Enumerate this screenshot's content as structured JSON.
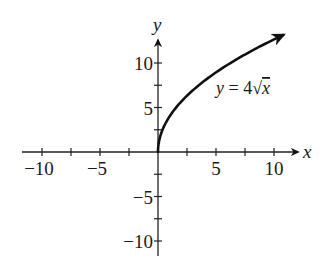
{
  "chart_data": {
    "type": "line",
    "title": "",
    "xlabel": "x",
    "ylabel": "y",
    "xlim": [
      -12,
      12
    ],
    "ylim": [
      -12,
      12.5
    ],
    "grid": false,
    "x_ticks": [
      -10,
      -7.5,
      -5,
      -2.5,
      2.5,
      5,
      7.5,
      10
    ],
    "y_ticks": [
      -10,
      -7.5,
      -5,
      -2.5,
      2.5,
      5,
      7.5,
      10
    ],
    "x_tick_labels": [
      {
        "value": -10,
        "label": "−10"
      },
      {
        "value": -5,
        "label": "−5"
      },
      {
        "value": 5,
        "label": "5"
      },
      {
        "value": 10,
        "label": "10"
      }
    ],
    "y_tick_labels": [
      {
        "value": 10,
        "label": "10"
      },
      {
        "value": 5,
        "label": "5"
      },
      {
        "value": -5,
        "label": "−5"
      },
      {
        "value": -10,
        "label": "−10"
      }
    ],
    "series": [
      {
        "name": "y = 4√x",
        "function": "4*sqrt(x)",
        "x_range": [
          0,
          10.8
        ],
        "x": [
          0,
          0.25,
          1,
          2,
          3,
          4,
          5,
          6,
          7,
          8,
          9,
          10,
          10.8
        ],
        "values": [
          0,
          2,
          4,
          5.66,
          6.93,
          8,
          8.94,
          9.8,
          10.58,
          11.31,
          12,
          12.65,
          13.15
        ],
        "arrow_end": true,
        "color": "#111111"
      }
    ],
    "annotations": [
      {
        "text": "y = 4√x",
        "x": 6.5,
        "y": 9.5
      }
    ]
  },
  "labels": {
    "x_axis": "x",
    "y_axis": "y",
    "equation_prefix": "y = 4",
    "equation_var": "x"
  }
}
